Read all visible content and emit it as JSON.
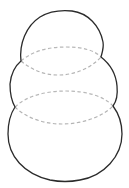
{
  "diagram": {
    "title": "",
    "colors": {
      "background": "#ffffff",
      "outline": "#2b2b2b",
      "dashed": "#b4b4b4"
    },
    "lobes": [
      {
        "name": "top-lobe",
        "top_y": 11,
        "left_x": 20,
        "right_x": 103
      },
      {
        "name": "middle-lobe",
        "left_x": 10,
        "right_x": 117,
        "y": 85
      },
      {
        "name": "bottom-lobe",
        "left_x": 8,
        "right_x": 122,
        "bottom_y": 181
      }
    ],
    "junctions": [
      {
        "name": "upper-junction",
        "left": [
          21,
          61
        ],
        "right": [
          101,
          57
        ]
      },
      {
        "name": "lower-junction",
        "left": [
          15,
          107
        ],
        "right": [
          113,
          106
        ]
      }
    ],
    "cross_sections": [
      {
        "name": "upper-cross-section",
        "style": "dashed",
        "top_y": 47,
        "bottom_y": 75
      },
      {
        "name": "lower-cross-section",
        "style": "dashed",
        "top_y": 91,
        "bottom_y": 124
      }
    ]
  }
}
